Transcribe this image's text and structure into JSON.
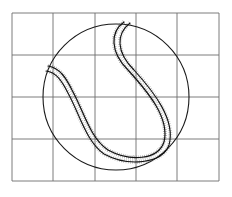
{
  "figure": {
    "colors": {
      "background": "#ffffff",
      "grid": "#6e6e6e",
      "circle": "#1a1a1a",
      "seam": "#111111",
      "stipple": "#555555"
    },
    "grid": {
      "columns": 5,
      "rows": 4,
      "x_lines": [
        12,
        53,
        95,
        136,
        177,
        219
      ],
      "y_lines": [
        13,
        55,
        97,
        139,
        181
      ]
    },
    "circle": {
      "cx": 116,
      "cy": 97,
      "r": 73
    },
    "seam": {
      "outer_path": "M124,22 C110,32 110,52 128,70 C148,92 170,118 164,142 C158,160 130,162 108,150 C90,138 84,112 72,90 C66,78 60,68 48,66",
      "inner_path": "M130,23 C116,34 116,52 134,70 C154,92 176,120 169,145 C162,164 128,167 104,154 C86,141 80,115 68,93 C62,81 56,72 46,71"
    }
  }
}
